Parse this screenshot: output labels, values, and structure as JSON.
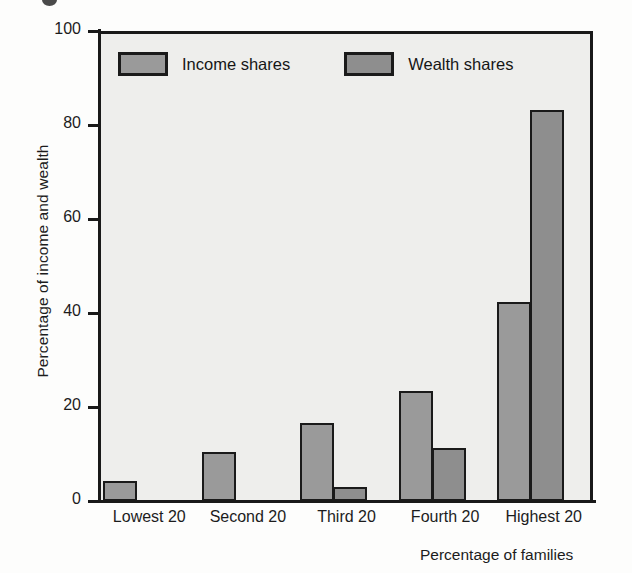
{
  "chart_data": {
    "type": "bar",
    "title": "",
    "xlabel": "Percentage of families",
    "ylabel": "Percentage of income and wealth",
    "categories": [
      "Lowest 20",
      "Second 20",
      "Third 20",
      "Fourth 20",
      "Highest 20"
    ],
    "series": [
      {
        "name": "Income shares",
        "color": "#9a9a9a",
        "values": [
          4.3,
          10.4,
          16.5,
          23.5,
          42.3
        ]
      },
      {
        "name": "Wealth shares",
        "color": "#8e8e8e",
        "values": [
          0,
          0,
          3.0,
          11.2,
          83.2
        ]
      }
    ],
    "ylim": [
      0,
      100
    ],
    "yticks": [
      0,
      20,
      40,
      60,
      80,
      100
    ],
    "ytick_labels": [
      "0",
      "20",
      "40",
      "60",
      "80",
      "100"
    ],
    "grid": false,
    "legend_position": "top-left-inside",
    "plot_background": "#eeeeec",
    "axis_color": "#191919"
  },
  "legend": {
    "entries": [
      {
        "label": "Income shares"
      },
      {
        "label": "Wealth shares"
      }
    ]
  },
  "axes": {
    "y_title": "Percentage of income and wealth",
    "x_title": "Percentage of families"
  }
}
